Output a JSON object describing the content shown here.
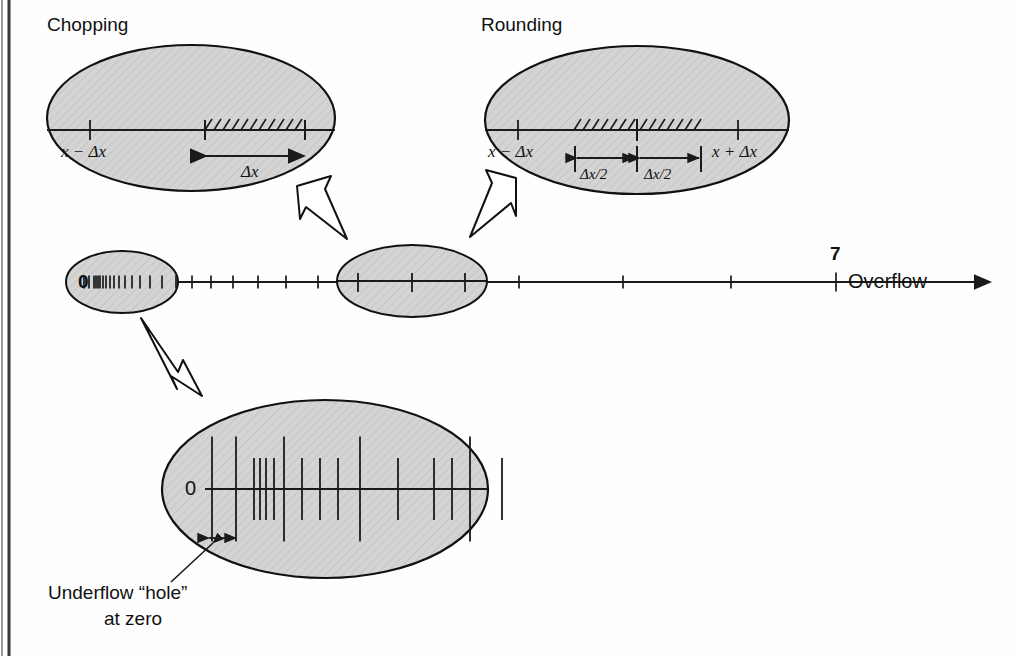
{
  "figure": {
    "title_chopping": "Chopping",
    "title_rounding": "Rounding",
    "overflow_label": "Overflow",
    "overflow_tick_label": "7",
    "underflow_caption_line1": "Underflow “hole”",
    "underflow_caption_line2": "at zero",
    "zero_label_main": "0",
    "zero_label_detail": "0",
    "colors": {
      "ellipse_fill": "#d2d2d2",
      "ellipse_stroke": "#111111",
      "line": "#1a1a1a",
      "background": "#fefefe",
      "page_edge": "#3a3a3a"
    }
  },
  "chopping": {
    "title": "Chopping",
    "left_tick_label": "x − Δx",
    "interval_label": "Δx",
    "hatch_count": 11
  },
  "rounding": {
    "title": "Rounding",
    "left_tick_label": "x − Δx",
    "right_tick_label": "x + Δx",
    "half_label_left": "Δx/2",
    "half_label_right": "Δx/2",
    "hatch_count_left": 7,
    "hatch_count_right": 7
  },
  "chart_data": {
    "type": "diagram",
    "axis": {
      "label_start": "0",
      "label_end": "7",
      "end_annotation": "Overflow",
      "direction": "right"
    },
    "main_line_ticks_x": [
      84,
      89,
      94,
      96,
      98,
      100,
      103,
      106,
      110,
      114,
      119,
      125,
      132,
      140,
      150,
      162,
      176,
      192,
      211,
      233,
      258,
      286,
      318,
      354,
      393,
      436,
      482,
      519,
      623,
      731,
      836
    ],
    "main_line_tick_heights": [
      13,
      13,
      13,
      13,
      13,
      13,
      13,
      13,
      13,
      13,
      13,
      13,
      13,
      13,
      13,
      13,
      13,
      13,
      13,
      13,
      13,
      13,
      13,
      13,
      13,
      13,
      13,
      13,
      13,
      13,
      19
    ],
    "detail_line_ticks": [
      {
        "x": 212,
        "h": 105
      },
      {
        "x": 236,
        "h": 105
      },
      {
        "x": 254,
        "h": 62
      },
      {
        "x": 260,
        "h": 62
      },
      {
        "x": 266,
        "h": 62
      },
      {
        "x": 274,
        "h": 62
      },
      {
        "x": 284,
        "h": 105
      },
      {
        "x": 302,
        "h": 62
      },
      {
        "x": 320,
        "h": 62
      },
      {
        "x": 338,
        "h": 62
      },
      {
        "x": 360,
        "h": 105
      },
      {
        "x": 398,
        "h": 62
      },
      {
        "x": 434,
        "h": 62
      },
      {
        "x": 452,
        "h": 62
      },
      {
        "x": 470,
        "h": 105
      },
      {
        "x": 502,
        "h": 62
      }
    ],
    "callouts": [
      {
        "from": "main-line-zero-region",
        "to": "underflow-detail-ellipse",
        "direction": "down-right"
      },
      {
        "from": "main-line-mid-region",
        "to": "chopping-ellipse",
        "direction": "up-left"
      },
      {
        "from": "main-line-mid-region",
        "to": "rounding-ellipse",
        "direction": "up-right"
      }
    ]
  }
}
